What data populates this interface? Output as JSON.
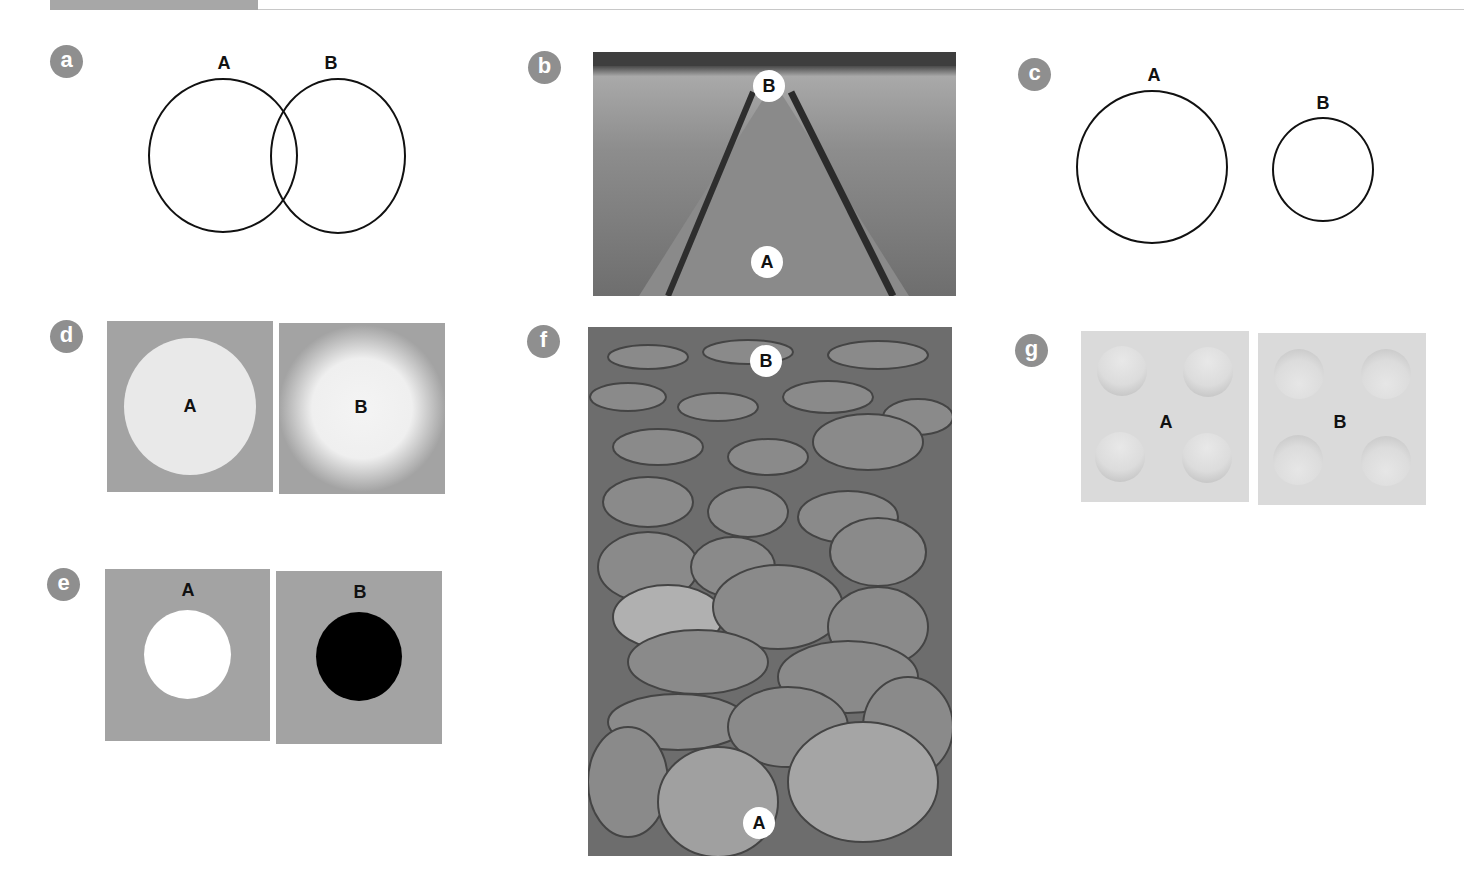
{
  "figure": {
    "panels": [
      {
        "id": "a",
        "badge": "a",
        "type": "overlapping-circles",
        "labels": [
          "A",
          "B"
        ]
      },
      {
        "id": "b",
        "badge": "b",
        "type": "photo-railway",
        "labels": [
          "A",
          "B"
        ]
      },
      {
        "id": "c",
        "badge": "c",
        "type": "separate-circles",
        "labels": [
          "A",
          "B"
        ]
      },
      {
        "id": "d",
        "badge": "d",
        "type": "sharp-vs-blurred-disc",
        "labels": [
          "A",
          "B"
        ]
      },
      {
        "id": "e",
        "badge": "e",
        "type": "white-vs-black-disc",
        "labels": [
          "A",
          "B"
        ]
      },
      {
        "id": "f",
        "badge": "f",
        "type": "photo-pebbles",
        "labels": [
          "B",
          "A"
        ]
      },
      {
        "id": "g",
        "badge": "g",
        "type": "bumps-vs-dents",
        "labels": [
          "A",
          "B"
        ]
      }
    ]
  },
  "colors": {
    "badge": "#8f8f8f",
    "panel_gray": "#a3a3a3",
    "disc_light": "#e8e8e8",
    "ink": "#111111"
  }
}
